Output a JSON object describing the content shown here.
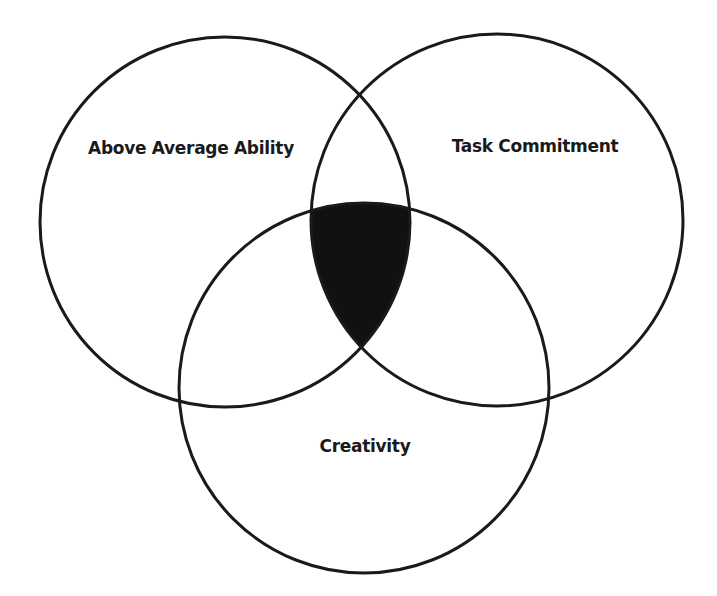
{
  "diagram": {
    "type": "venn",
    "colors": {
      "background": "#ffffff",
      "stroke": "#1a1a1a",
      "intersection_fill": "#111111"
    },
    "sets": [
      {
        "id": "above-average-ability",
        "label": "Above Average Ability",
        "cx": 225,
        "cy": 222,
        "r": 185,
        "label_x": 191,
        "label_y": 154
      },
      {
        "id": "task-commitment",
        "label": "Task Commitment",
        "cx": 497,
        "cy": 220,
        "r": 186,
        "label_x": 535,
        "label_y": 152
      },
      {
        "id": "creativity",
        "label": "Creativity",
        "cx": 364,
        "cy": 388,
        "r": 185,
        "label_x": 365,
        "label_y": 452
      }
    ],
    "highlighted_region": {
      "description": "Intersection of all three circles",
      "fill": "#111111"
    }
  }
}
